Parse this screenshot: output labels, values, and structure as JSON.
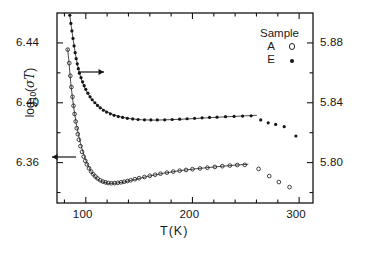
{
  "chart_data": {
    "type": "scatter",
    "title": "",
    "xlabel": "T(K)",
    "ylabel_left": "log10(σT)",
    "ylabel_left_parts": {
      "base": "log",
      "sub": "10",
      "open": "(",
      "sigma": "σ",
      "tee": "T",
      "close": ")"
    },
    "xlim": [
      73,
      313
    ],
    "xticks": [
      100,
      200,
      300
    ],
    "xticklabels": [
      "100",
      "200",
      "300"
    ],
    "xminorticks": [
      80,
      120,
      140,
      160,
      180,
      220,
      240,
      260,
      280
    ],
    "ylim_left": [
      6.333,
      6.46
    ],
    "yticks_left": [
      6.36,
      6.4,
      6.44
    ],
    "yticklabels_left": [
      "6.36",
      "6.40",
      "6.44"
    ],
    "ylim_right": [
      5.773,
      5.9
    ],
    "yticks_right": [
      5.8,
      5.84,
      5.88
    ],
    "yticklabels_right": [
      "5.80",
      "5.84",
      "5.88"
    ],
    "grid": false,
    "legend_title": "Sample",
    "legend_position": "top-right",
    "legend": [
      {
        "name": "A",
        "marker": "open-circle",
        "axis": "left"
      },
      {
        "name": "E",
        "marker": "filled-circle",
        "axis": "right"
      }
    ],
    "annotations": [
      {
        "name": "arrow-to-right-axis",
        "text": "→",
        "direction": "right",
        "x_k": 95,
        "y_left": 6.419,
        "series": "E"
      },
      {
        "name": "arrow-to-left-axis",
        "text": "←",
        "direction": "left",
        "x_k": 88,
        "y_left": 6.3615,
        "series": "A"
      }
    ],
    "series": [
      {
        "name": "A",
        "marker": "open-circle",
        "axis": "left",
        "points": [
          [
            83.0,
            6.4355
          ],
          [
            84.5,
            6.4265
          ],
          [
            85.5,
            6.418
          ],
          [
            86.5,
            6.4105
          ],
          [
            87.5,
            6.404
          ],
          [
            88.5,
            6.398
          ],
          [
            89.5,
            6.3925
          ],
          [
            90.5,
            6.3875
          ],
          [
            91.5,
            6.383
          ],
          [
            92.5,
            6.379
          ],
          [
            93.5,
            6.3753
          ],
          [
            95.0,
            6.371
          ],
          [
            96.5,
            6.3672
          ],
          [
            98.0,
            6.364
          ],
          [
            99.5,
            6.3612
          ],
          [
            101.0,
            6.3588
          ],
          [
            103.0,
            6.3562
          ],
          [
            105.0,
            6.354
          ],
          [
            107.0,
            6.3522
          ],
          [
            109.0,
            6.3507
          ],
          [
            111.0,
            6.3494
          ],
          [
            113.5,
            6.3482
          ],
          [
            116.0,
            6.3473
          ],
          [
            118.5,
            6.3468
          ],
          [
            121.0,
            6.3464
          ],
          [
            124.0,
            6.3462
          ],
          [
            127.0,
            6.3463
          ],
          [
            130.0,
            6.3465
          ],
          [
            133.0,
            6.3468
          ],
          [
            136.0,
            6.3472
          ],
          [
            139.0,
            6.3477
          ],
          [
            142.0,
            6.3482
          ],
          [
            146.0,
            6.3489
          ],
          [
            150.0,
            6.3496
          ],
          [
            155.0,
            6.3504
          ],
          [
            160.0,
            6.3512
          ],
          [
            165.0,
            6.3519
          ],
          [
            170.0,
            6.3526
          ],
          [
            176.0,
            6.3533
          ],
          [
            182.0,
            6.354
          ],
          [
            188.0,
            6.3546
          ],
          [
            194.0,
            6.3551
          ],
          [
            200.0,
            6.3556
          ],
          [
            207.0,
            6.3561
          ],
          [
            214.0,
            6.3566
          ],
          [
            221.0,
            6.3571
          ],
          [
            228.0,
            6.3576
          ],
          [
            235.0,
            6.358
          ],
          [
            242.0,
            6.3584
          ],
          [
            249.0,
            6.3585
          ],
          [
            262.0,
            6.3558
          ],
          [
            272.0,
            6.351
          ],
          [
            281.0,
            6.347
          ],
          [
            291.0,
            6.3436
          ]
        ]
      },
      {
        "name": "E",
        "marker": "filled-circle",
        "axis": "right",
        "points": [
          [
            85.0,
            5.8985
          ],
          [
            86.0,
            5.893
          ],
          [
            87.0,
            5.888
          ],
          [
            88.0,
            5.883
          ],
          [
            89.0,
            5.878
          ],
          [
            90.0,
            5.8735
          ],
          [
            91.0,
            5.8695
          ],
          [
            92.0,
            5.866
          ],
          [
            93.0,
            5.8628
          ],
          [
            94.0,
            5.8598
          ],
          [
            95.5,
            5.8568
          ],
          [
            97.0,
            5.854
          ],
          [
            98.5,
            5.8514
          ],
          [
            100.0,
            5.849
          ],
          [
            102.0,
            5.8464
          ],
          [
            104.0,
            5.844
          ],
          [
            106.0,
            5.842
          ],
          [
            108.5,
            5.84
          ],
          [
            111.0,
            5.8382
          ],
          [
            113.5,
            5.8366
          ],
          [
            116.5,
            5.835
          ],
          [
            119.5,
            5.8338
          ],
          [
            123.0,
            5.8326
          ],
          [
            126.5,
            5.8316
          ],
          [
            130.5,
            5.8308
          ],
          [
            134.5,
            5.8302
          ],
          [
            139.0,
            5.8296
          ],
          [
            144.0,
            5.8292
          ],
          [
            149.0,
            5.8288
          ],
          [
            155.0,
            5.8286
          ],
          [
            161.0,
            5.8285
          ],
          [
            167.0,
            5.8285
          ],
          [
            174.0,
            5.8286
          ],
          [
            181.0,
            5.8288
          ],
          [
            188.0,
            5.829
          ],
          [
            195.0,
            5.8293
          ],
          [
            202.0,
            5.8296
          ],
          [
            209.0,
            5.8299
          ],
          [
            216.0,
            5.8302
          ],
          [
            223.0,
            5.8304
          ],
          [
            231.0,
            5.8307
          ],
          [
            239.0,
            5.8309
          ],
          [
            247.0,
            5.8311
          ],
          [
            255.0,
            5.8313
          ],
          [
            264.0,
            5.8285
          ],
          [
            271.0,
            5.8266
          ],
          [
            278.0,
            5.8255
          ],
          [
            286.0,
            5.824
          ],
          [
            297.0,
            5.8178
          ]
        ]
      }
    ],
    "fit_lines": [
      {
        "name": "fit-A",
        "axis": "left",
        "points": [
          [
            83.0,
            6.436
          ],
          [
            84.0,
            6.429
          ],
          [
            85.0,
            6.4205
          ],
          [
            86.0,
            6.4125
          ],
          [
            87.5,
            6.4032
          ],
          [
            89.0,
            6.3952
          ],
          [
            91.0,
            6.3862
          ],
          [
            93.0,
            6.3789
          ],
          [
            95.0,
            6.3728
          ],
          [
            98.0,
            6.3654
          ],
          [
            101.0,
            6.3597
          ],
          [
            105.0,
            6.354
          ],
          [
            110.0,
            6.3494
          ],
          [
            115.0,
            6.3472
          ],
          [
            121.0,
            6.3461
          ],
          [
            128.0,
            6.3462
          ],
          [
            136.0,
            6.3471
          ],
          [
            146.0,
            6.3487
          ],
          [
            158.0,
            6.3508
          ],
          [
            172.0,
            6.3528
          ],
          [
            188.0,
            6.3546
          ],
          [
            205.0,
            6.356
          ],
          [
            222.0,
            6.3572
          ],
          [
            240.0,
            6.3583
          ],
          [
            252.0,
            6.3589
          ]
        ]
      },
      {
        "name": "fit-E",
        "axis": "right",
        "points": [
          [
            85.0,
            5.8985
          ],
          [
            86.5,
            5.8905
          ],
          [
            88.0,
            5.8828
          ],
          [
            90.0,
            5.8737
          ],
          [
            92.0,
            5.866
          ],
          [
            94.5,
            5.8588
          ],
          [
            97.0,
            5.8533
          ],
          [
            100.0,
            5.8484
          ],
          [
            104.0,
            5.8438
          ],
          [
            108.0,
            5.8403
          ],
          [
            113.0,
            5.8371
          ],
          [
            119.0,
            5.8343
          ],
          [
            126.0,
            5.832
          ],
          [
            134.0,
            5.8303
          ],
          [
            143.0,
            5.8292
          ],
          [
            153.0,
            5.8286
          ],
          [
            165.0,
            5.8284
          ],
          [
            180.0,
            5.8287
          ],
          [
            196.0,
            5.8292
          ],
          [
            213.0,
            5.8299
          ],
          [
            231.0,
            5.8306
          ],
          [
            248.0,
            5.8312
          ],
          [
            260.0,
            5.8316
          ]
        ]
      }
    ]
  },
  "legend_block": {
    "title": "Sample",
    "rows": [
      {
        "label": "A",
        "marker": "open-circle"
      },
      {
        "label": "E",
        "marker": "filled-circle"
      }
    ]
  },
  "axis_text": {
    "xlabel": "T(K)",
    "x_ticks": [
      "100",
      "200",
      "300"
    ],
    "y_left_ticks": [
      "6.36",
      "6.40",
      "6.44"
    ],
    "y_right_ticks": [
      "5.80",
      "5.84",
      "5.88"
    ],
    "ylabel_base": "log",
    "ylabel_sub": "10",
    "ylabel_arg_open": "(",
    "ylabel_sigma": "σ",
    "ylabel_T": "T",
    "ylabel_arg_close": ")"
  },
  "colors": {
    "ink": "#151515",
    "background": "#ffffff",
    "curve": "#2a2a2a"
  }
}
